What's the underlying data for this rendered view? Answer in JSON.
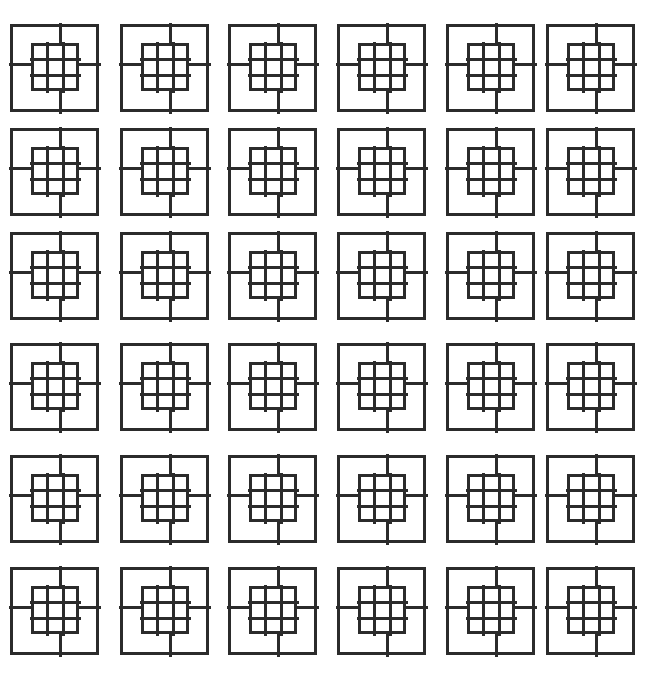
{
  "artwork": {
    "title": "Repeating Square Lattice Motif",
    "type": "geometric-line-pattern",
    "canvas": {
      "width": 646,
      "height": 682
    },
    "background_color": "#ffffff",
    "stroke_color": "#2b2b2b",
    "stroke_width": 3,
    "inner_stroke_width": 3,
    "grid": {
      "columns": 6,
      "rows": 6,
      "column_x": [
        10,
        120,
        228,
        337,
        446,
        546
      ],
      "row_y": [
        24,
        128,
        232,
        343,
        455,
        567
      ],
      "tile_width": 89,
      "tile_height": 88,
      "column_pitch": 106,
      "row_pitch_upper_band": 104,
      "row_pitch_lower_band": 112,
      "band_gap_after_row": 3
    },
    "tile": {
      "name": "nested-square-grid-tile",
      "outer_square": {
        "x": 0,
        "y": 0,
        "width": 89,
        "height": 88
      },
      "inner_grid": {
        "x": 21,
        "y": 19,
        "width": 48,
        "height": 48,
        "divisions": 3,
        "cells": 9
      },
      "connectors": [
        {
          "name": "connector-top",
          "orientation": "vertical",
          "offset_along_side": 0.56
        },
        {
          "name": "connector-bottom",
          "orientation": "vertical",
          "offset_along_side": 0.56
        },
        {
          "name": "connector-left",
          "orientation": "horizontal",
          "offset_along_side": 0.46
        },
        {
          "name": "connector-right",
          "orientation": "horizontal",
          "offset_along_side": 0.46
        }
      ]
    },
    "tile_count": 36
  }
}
